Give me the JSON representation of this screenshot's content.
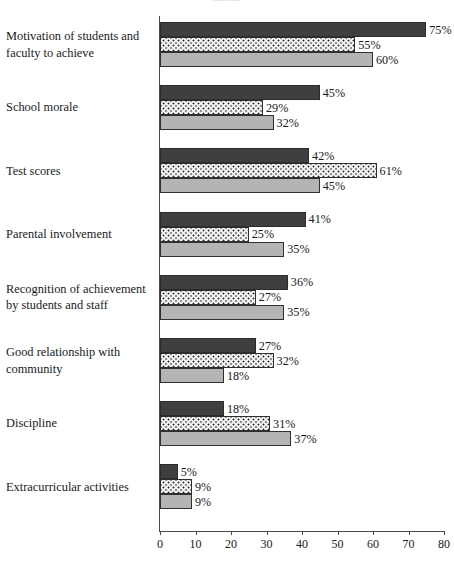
{
  "chart_data": {
    "type": "bar",
    "orientation": "horizontal",
    "title": "",
    "xlabel": "",
    "ylabel": "",
    "xlim": [
      0,
      80
    ],
    "xticks": [
      "0",
      "10",
      "20",
      "30",
      "40",
      "50",
      "60",
      "70",
      "80"
    ],
    "grid": false,
    "legend": "none",
    "value_suffix": "%",
    "categories": [
      "Motivation of students and faculty to achieve",
      "School morale",
      "Test scores",
      "Parental involvement",
      "Recognition of achievement by students and staff",
      "Good relationship with community",
      "Discipline",
      "Extracurricular activities"
    ],
    "category_lines": [
      [
        "Motivation of students and",
        "faculty to achieve"
      ],
      [
        "School morale"
      ],
      [
        "Test scores"
      ],
      [
        "Parental involvement"
      ],
      [
        "Recognition of achievement",
        "by students and staff"
      ],
      [
        "Good relationship with",
        "community"
      ],
      [
        "Discipline"
      ],
      [
        "Extracurricular activities"
      ]
    ],
    "series": [
      {
        "name": "series-1",
        "style": "dark-gray-solid",
        "color": "#3f3f3f",
        "values": [
          75,
          45,
          42,
          41,
          36,
          27,
          18,
          5
        ],
        "labels": [
          "75%",
          "45%",
          "42%",
          "41%",
          "36%",
          "27%",
          "18%",
          "5%"
        ]
      },
      {
        "name": "series-2",
        "style": "white-dotted",
        "color": "#ffffff",
        "values": [
          55,
          29,
          61,
          25,
          27,
          32,
          31,
          9
        ],
        "labels": [
          "55%",
          "29%",
          "61%",
          "25%",
          "27%",
          "32%",
          "31%",
          "9%"
        ]
      },
      {
        "name": "series-3",
        "style": "light-gray-solid",
        "color": "#b4b4b4",
        "values": [
          60,
          32,
          45,
          35,
          35,
          18,
          37,
          9
        ],
        "labels": [
          "60%",
          "32%",
          "45%",
          "35%",
          "35%",
          "18%",
          "37%",
          "9%"
        ]
      }
    ]
  },
  "axis": {
    "tick_labels": [
      "0",
      "10",
      "20",
      "30",
      "40",
      "50",
      "60",
      "70",
      "80"
    ]
  },
  "title_remnant": "........."
}
